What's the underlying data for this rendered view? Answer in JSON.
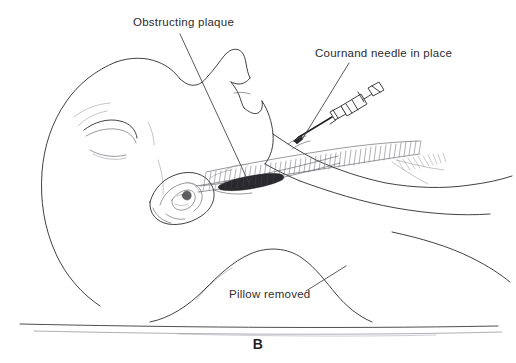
{
  "figure": {
    "panel_letter": "B",
    "background_color": "#ffffff",
    "ink_color": "#2b2b2f"
  },
  "callouts": [
    {
      "id": "obstructing-plaque",
      "text": "Obstructing plaque",
      "points_to": "carotid-plaque"
    },
    {
      "id": "cournand-needle",
      "text": "Cournand needle in place",
      "points_to": "needle-puncture-site"
    },
    {
      "id": "pillow-removed",
      "text": "Pillow removed",
      "points_to": "shoulder-contour"
    }
  ],
  "anatomy": {
    "head": "lateral-profile-extended",
    "ear": "auricle-detail",
    "neck": "sternocleidomastoid-hatched",
    "vessel": "carotid-artery",
    "lesion": "atheromatous-plaque",
    "support": "shoulder-and-chest"
  },
  "instrument": {
    "name": "Cournand needle with syringe",
    "parts": [
      "needle-shaft",
      "needle-hub",
      "syringe-barrel",
      "plunger-flange"
    ]
  },
  "surface": {
    "name": "operating-table",
    "lines": 2
  }
}
